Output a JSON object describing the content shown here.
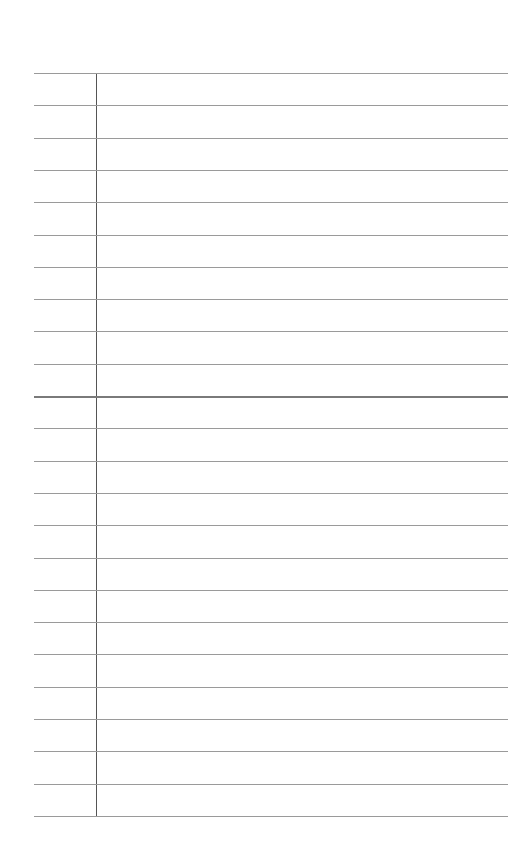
{
  "document": {
    "type": "lined-paper",
    "ruled_lines": 24,
    "line_spacing_px": 32.3,
    "first_line_y": 73,
    "margin_line_x": 96,
    "colors": {
      "paper": "#ffffff",
      "rule": "#9a9a9a",
      "margin": "#555555"
    }
  }
}
